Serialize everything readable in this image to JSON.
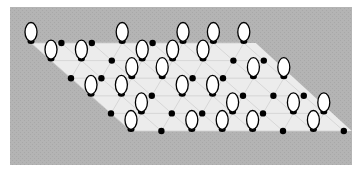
{
  "diagram": {
    "colors": {
      "page": "#ffffff",
      "panel": "#b4b4b4",
      "lattice_fill": "#ececec",
      "grid_line": "#d0d0d0",
      "oval_fill": "#ffffff",
      "oval_stroke": "#000000",
      "dot": "#000000"
    },
    "panel": {
      "x": 10,
      "y": 7,
      "width": 342,
      "height": 158
    },
    "lattice": {
      "origin": {
        "x": 31,
        "y": 43
      },
      "col_step": {
        "dx": 30.4,
        "dy": 0
      },
      "row_step": {
        "dx": 20,
        "dy": 17.6
      },
      "rows": 6,
      "cols": 8,
      "sites": [
        [
          "O",
          "D",
          "D",
          "O",
          "D",
          "O",
          "O",
          "O"
        ],
        [
          "O",
          "O",
          "D",
          "O",
          "O",
          "O",
          "D",
          "D"
        ],
        [
          "D",
          "D",
          "O",
          "O",
          "D",
          "D",
          "O",
          "O"
        ],
        [
          "O",
          "O",
          "D",
          "O",
          "O",
          "D",
          "D",
          "D"
        ],
        [
          "D",
          "O",
          "D",
          "D",
          "O",
          "D",
          "O",
          "O"
        ],
        [
          "O",
          "D",
          "O",
          "O",
          "O",
          "D",
          "O",
          "D"
        ]
      ],
      "legend": {
        "O": "oval",
        "D": "dot"
      }
    }
  }
}
